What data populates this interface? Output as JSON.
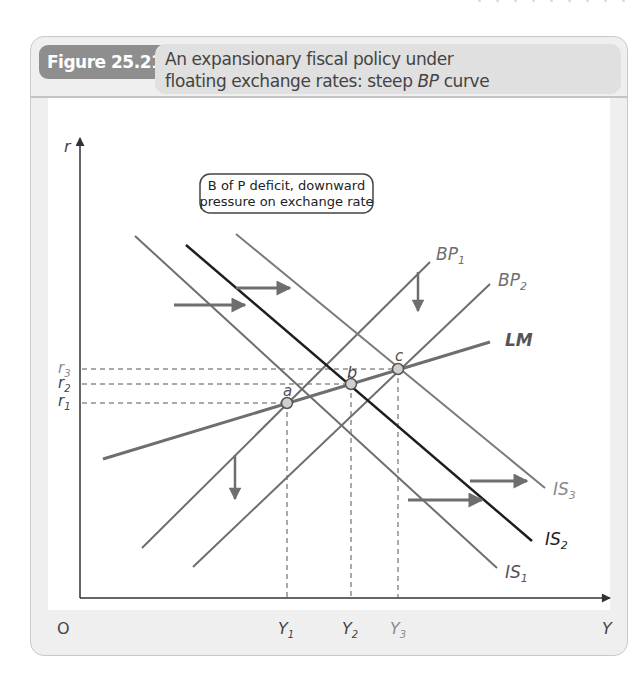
{
  "figure": {
    "number": "Figure 25.21",
    "title_line1": "An expansionary fiscal policy under",
    "title_line2_prefix": "floating exchange rates: steep ",
    "title_line2_italic": "BP",
    "title_line2_suffix": " curve"
  },
  "callout": {
    "line1": "B of P deficit, downward",
    "line2": "pressure on exchange rate"
  },
  "axes": {
    "y_label": "r",
    "x_label": "Y",
    "origin_label": "O"
  },
  "r_ticks": [
    {
      "base": "r",
      "sub": "3"
    },
    {
      "base": "r",
      "sub": "2"
    },
    {
      "base": "r",
      "sub": "1"
    }
  ],
  "y_ticks": [
    {
      "base": "Y",
      "sub": "1"
    },
    {
      "base": "Y",
      "sub": "2"
    },
    {
      "base": "Y",
      "sub": "3"
    }
  ],
  "points": [
    {
      "label": "a"
    },
    {
      "label": "b"
    },
    {
      "label": "c"
    }
  ],
  "curves": {
    "bp1": {
      "base": "BP",
      "sub": "1"
    },
    "bp2": {
      "base": "BP",
      "sub": "2"
    },
    "lm": {
      "base": "LM",
      "sub": ""
    },
    "is1": {
      "base": "IS",
      "sub": "1"
    },
    "is2": {
      "base": "IS",
      "sub": "2"
    },
    "is3": {
      "base": "IS",
      "sub": "3"
    }
  },
  "colors": {
    "curve_gray": "#6e6e6e",
    "is2_dark": "#1e1e1e",
    "light_label": "#8a8a8a",
    "point_fill": "#cfcfcf"
  }
}
